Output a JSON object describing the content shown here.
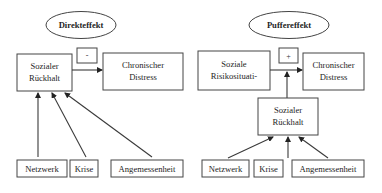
{
  "diagrams": [
    {
      "title": "Direkteffekt",
      "symbol": "-",
      "predictor": {
        "line1": "Sozialer",
        "line2": "Rückhalt"
      },
      "outcome": {
        "line1": "Chronischer",
        "line2": "Distress"
      },
      "components": [
        "Netzwerk",
        "Krise",
        "Angemessenheit"
      ]
    },
    {
      "title": "Puffereffekt",
      "symbol": "+",
      "predictor": {
        "line1": "Soziale",
        "line2": "Risikosituati-"
      },
      "outcome": {
        "line1": "Chronischer",
        "line2": "Distress"
      },
      "moderator": {
        "line1": "Sozialer",
        "line2": "Rückhalt"
      },
      "components": [
        "Netzwerk",
        "Krise",
        "Angemessenheit"
      ]
    }
  ],
  "colors": {
    "stroke": "#444444",
    "text": "#1e1e1e",
    "background": "#ffffff"
  }
}
